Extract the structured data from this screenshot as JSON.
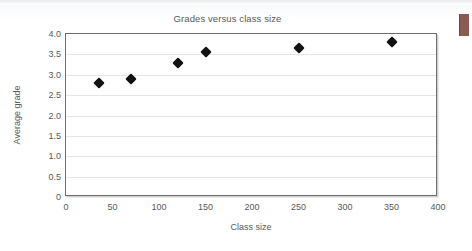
{
  "page": {
    "background_color": "#ffffff",
    "edge_marker_color": "#8d5a53",
    "edge_marker_name": "page-edge-marker"
  },
  "chart_data": {
    "type": "scatter",
    "title": "Grades versus class size",
    "xlabel": "Class size",
    "ylabel": "Average grade",
    "xlim": [
      0,
      400
    ],
    "ylim": [
      0,
      4.0
    ],
    "grid": true,
    "legend": null,
    "marker_style": "filled-diamond",
    "marker_color": "#111111",
    "xticks": [
      "0",
      "50",
      "100",
      "150",
      "200",
      "250",
      "300",
      "350",
      "400"
    ],
    "xtick_values": [
      0,
      50,
      100,
      150,
      200,
      250,
      300,
      350,
      400
    ],
    "yticks": [
      "0",
      "0.5",
      "1.0",
      "1.5",
      "2.0",
      "2.5",
      "3.0",
      "3.5",
      "4.0"
    ],
    "ytick_values": [
      0,
      0.5,
      1.0,
      1.5,
      2.0,
      2.5,
      3.0,
      3.5,
      4.0
    ],
    "x": [
      35,
      70,
      120,
      150,
      250,
      350
    ],
    "y": [
      2.8,
      2.9,
      3.3,
      3.55,
      3.65,
      3.8
    ],
    "points": [
      {
        "x": 35,
        "y": 2.8
      },
      {
        "x": 70,
        "y": 2.9
      },
      {
        "x": 120,
        "y": 3.3
      },
      {
        "x": 150,
        "y": 3.55
      },
      {
        "x": 250,
        "y": 3.65
      },
      {
        "x": 350,
        "y": 3.8
      }
    ]
  }
}
